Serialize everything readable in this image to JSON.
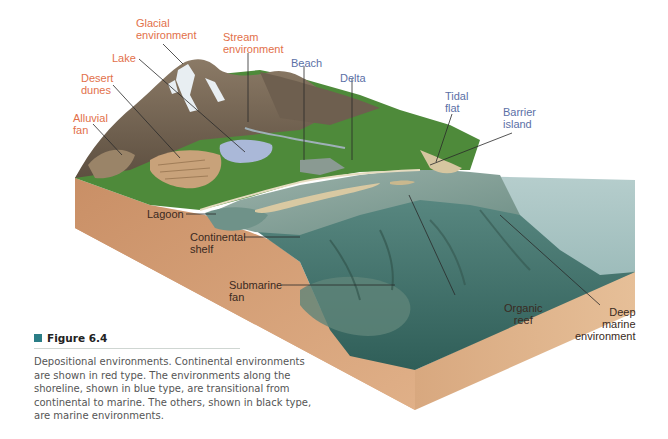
{
  "diagram": {
    "type": "block-diagram",
    "subject": "Depositional environments",
    "labels": {
      "continental": [
        {
          "id": "glacial",
          "text": "Glacial\nenvironment"
        },
        {
          "id": "stream",
          "text": "Stream\nenvironment"
        },
        {
          "id": "lake",
          "text": "Lake"
        },
        {
          "id": "desert",
          "text": "Desert\ndunes"
        },
        {
          "id": "alluvial",
          "text": "Alluvial\nfan"
        }
      ],
      "transitional": [
        {
          "id": "beach",
          "text": "Beach"
        },
        {
          "id": "delta",
          "text": "Delta"
        },
        {
          "id": "tidal",
          "text": "Tidal\nflat"
        },
        {
          "id": "barrier",
          "text": "Barrier\nisland"
        }
      ],
      "marine": [
        {
          "id": "lagoon",
          "text": "Lagoon"
        },
        {
          "id": "shelf",
          "text": "Continental\nshelf"
        },
        {
          "id": "fan",
          "text": "Submarine\nfan"
        },
        {
          "id": "reef",
          "text": "Organic\nreef"
        },
        {
          "id": "deep",
          "text": "Deep\nmarine\nenvironment"
        }
      ]
    },
    "colors": {
      "continental": "#e2704a",
      "transitional": "#5b70a6",
      "marine": "#3a2a22",
      "sediment": "#d9a57b",
      "ocean": "#3f6e68",
      "shallow_water": "#8fa8a0",
      "vegetation": "#4e8a3a",
      "rock": "#7a6a58",
      "figure_marker": "#2a7d86"
    }
  },
  "caption": {
    "figure_label": "Figure 6.4",
    "text": "Depositional environments. Continental environments are shown in red type. The environments along the shoreline, shown in blue type, are transitional from continental to marine. The others, shown in black type, are marine environments."
  }
}
